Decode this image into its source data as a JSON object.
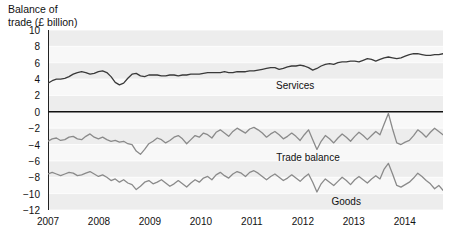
{
  "chart_data": {
    "type": "line",
    "title": "Balance of\ntrade (£ billion)",
    "ylabel": "Balance of trade (£ billion)",
    "xlabel": "",
    "ylim": [
      -12,
      10
    ],
    "xlim": [
      2007,
      2014.75
    ],
    "yticks": [
      10,
      8,
      6,
      4,
      2,
      0,
      -2,
      -4,
      -6,
      -8,
      -10,
      -12
    ],
    "ytick_labels": [
      "10",
      "8",
      "6",
      "4",
      "2",
      "0",
      "−2",
      "−4",
      "−6",
      "−8",
      "−10",
      "−12"
    ],
    "xticks": [
      2007,
      2008,
      2009,
      2010,
      2011,
      2012,
      2013,
      2014
    ],
    "xtick_labels": [
      "2007",
      "2008",
      "2009",
      "2010",
      "2011",
      "2012",
      "2013",
      "2014"
    ],
    "grid": true,
    "grid_style": "horizontal-banded",
    "legend": "inline-labels",
    "zero_line": 0,
    "series": [
      {
        "name": "Services",
        "color": "#3a3a3a",
        "label_x": 2011.85,
        "label_y": 3.1,
        "values": [
          3.5,
          3.8,
          4.0,
          4.0,
          4.1,
          4.3,
          4.6,
          4.8,
          4.9,
          4.8,
          4.6,
          4.7,
          4.9,
          5.0,
          4.8,
          4.3,
          3.6,
          3.3,
          3.5,
          4.1,
          4.6,
          4.7,
          4.4,
          4.3,
          4.5,
          4.5,
          4.5,
          4.4,
          4.4,
          4.5,
          4.5,
          4.4,
          4.5,
          4.5,
          4.6,
          4.6,
          4.6,
          4.7,
          4.8,
          4.8,
          4.8,
          4.8,
          4.9,
          4.8,
          4.8,
          4.9,
          4.9,
          4.9,
          5.0,
          5.0,
          5.1,
          5.2,
          5.3,
          5.4,
          5.4,
          5.2,
          5.3,
          5.5,
          5.6,
          5.6,
          5.7,
          5.6,
          5.4,
          5.1,
          5.3,
          5.6,
          5.8,
          5.9,
          5.8,
          6.0,
          6.1,
          6.1,
          6.2,
          6.2,
          6.1,
          6.3,
          6.5,
          6.4,
          6.2,
          6.4,
          6.6,
          6.7,
          6.6,
          6.5,
          6.6,
          6.8,
          7.0,
          7.1,
          7.1,
          7.0,
          6.9,
          6.9,
          7.0,
          7.0,
          7.1
        ]
      },
      {
        "name": "Trade balance",
        "color": "#8a8a8a",
        "label_x": 2012.1,
        "label_y": -5.6,
        "values": [
          -3.6,
          -3.3,
          -3.2,
          -3.5,
          -3.4,
          -3.1,
          -3.0,
          -3.3,
          -3.4,
          -3.0,
          -2.7,
          -3.1,
          -3.3,
          -3.1,
          -3.4,
          -3.6,
          -3.5,
          -3.7,
          -3.6,
          -3.9,
          -4.0,
          -4.8,
          -5.2,
          -4.6,
          -3.9,
          -3.6,
          -3.2,
          -3.4,
          -3.8,
          -3.5,
          -3.1,
          -2.9,
          -3.3,
          -3.9,
          -3.4,
          -2.9,
          -3.1,
          -2.6,
          -2.8,
          -3.2,
          -2.5,
          -2.2,
          -2.6,
          -3.0,
          -2.4,
          -2.0,
          -2.3,
          -2.6,
          -2.1,
          -1.9,
          -2.2,
          -2.6,
          -3.1,
          -2.7,
          -2.4,
          -2.8,
          -3.3,
          -3.0,
          -2.6,
          -3.0,
          -3.5,
          -2.8,
          -2.2,
          -3.4,
          -4.6,
          -3.6,
          -2.9,
          -3.3,
          -3.8,
          -3.2,
          -2.7,
          -3.1,
          -3.6,
          -3.0,
          -2.5,
          -2.9,
          -3.4,
          -2.9,
          -2.4,
          -2.8,
          -1.5,
          -0.2,
          -2.1,
          -3.8,
          -4.0,
          -3.7,
          -3.5,
          -2.9,
          -2.2,
          -2.6,
          -3.1,
          -2.5,
          -2.0,
          -2.4,
          -2.8
        ]
      },
      {
        "name": "Goods",
        "color": "#8a8a8a",
        "label_x": 2012.85,
        "label_y": -11.0,
        "values": [
          -7.6,
          -7.4,
          -7.6,
          -7.8,
          -7.6,
          -7.4,
          -7.5,
          -7.8,
          -7.7,
          -7.5,
          -7.3,
          -7.6,
          -7.9,
          -7.7,
          -8.0,
          -8.4,
          -8.2,
          -8.6,
          -8.3,
          -8.7,
          -8.9,
          -9.5,
          -9.1,
          -8.6,
          -8.4,
          -8.8,
          -8.6,
          -8.3,
          -8.7,
          -9.1,
          -8.8,
          -8.4,
          -8.8,
          -9.2,
          -8.7,
          -8.3,
          -8.6,
          -8.1,
          -7.9,
          -8.3,
          -7.7,
          -7.4,
          -7.8,
          -8.1,
          -7.6,
          -7.3,
          -7.5,
          -7.9,
          -7.4,
          -7.2,
          -7.5,
          -7.9,
          -8.3,
          -7.9,
          -7.6,
          -8.0,
          -8.4,
          -8.1,
          -7.7,
          -8.1,
          -8.5,
          -8.0,
          -7.6,
          -8.6,
          -9.8,
          -8.8,
          -8.2,
          -8.6,
          -9.0,
          -8.5,
          -8.0,
          -8.4,
          -8.9,
          -8.3,
          -7.9,
          -8.3,
          -8.7,
          -8.2,
          -7.8,
          -8.2,
          -7.0,
          -6.3,
          -7.6,
          -9.0,
          -9.2,
          -8.9,
          -8.6,
          -8.1,
          -7.5,
          -7.9,
          -8.4,
          -8.8,
          -9.4,
          -9.0,
          -9.6
        ]
      }
    ]
  }
}
